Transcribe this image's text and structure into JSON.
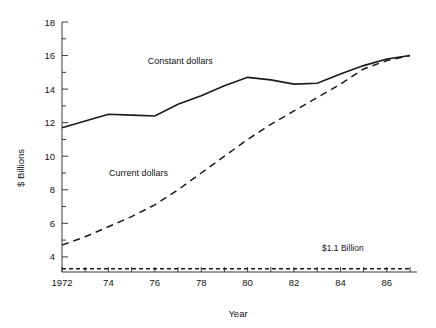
{
  "chart_data": {
    "type": "line",
    "title": "",
    "xlabel": "Year",
    "ylabel": "$ Billions",
    "xlim": [
      1972,
      1987.3
    ],
    "ylim": [
      3.1,
      18
    ],
    "grid": false,
    "legend": "inline-labels",
    "y_ticks_major": [
      4,
      6,
      8,
      10,
      12,
      14,
      16,
      18
    ],
    "y_ticks_minor": [
      5,
      7,
      9,
      11,
      13,
      15,
      17
    ],
    "y_tick_labels": [
      "4",
      "6",
      "8",
      "10",
      "12",
      "14",
      "16",
      "18"
    ],
    "x_ticks": [
      1972,
      1973,
      1974,
      1975,
      1976,
      1977,
      1978,
      1979,
      1980,
      1981,
      1982,
      1983,
      1984,
      1985,
      1986,
      1987
    ],
    "x_tick_labels": [
      "1972",
      "",
      "74",
      "",
      "76",
      "",
      "78",
      "",
      "80",
      "",
      "82",
      "",
      "84",
      "",
      "86",
      ""
    ],
    "x": [
      1972,
      1973,
      1974,
      1975,
      1976,
      1977,
      1978,
      1979,
      1980,
      1981,
      1982,
      1983,
      1984,
      1985,
      1986,
      1987
    ],
    "series": [
      {
        "name": "Constant dollars",
        "style": "solid",
        "color": "#1a1a1a",
        "label": "Constant dollars",
        "values": [
          11.7,
          12.1,
          12.5,
          12.45,
          12.4,
          13.1,
          13.6,
          14.2,
          14.7,
          14.55,
          14.3,
          14.35,
          14.9,
          15.4,
          15.8,
          16.0
        ]
      },
      {
        "name": "Current dollars",
        "style": "dashed",
        "color": "#1a1a1a",
        "label": "Current dollars",
        "values": [
          4.7,
          5.2,
          5.8,
          6.4,
          7.1,
          8.0,
          9.0,
          10.0,
          11.0,
          11.9,
          12.7,
          13.5,
          14.3,
          15.2,
          15.7,
          16.0
        ]
      },
      {
        "name": "Baseline",
        "style": "dotted",
        "color": "#1a1a1a",
        "label": "$1.1 Billion",
        "values": [
          3.3,
          3.3,
          3.3,
          3.3,
          3.3,
          3.3,
          3.3,
          3.3,
          3.3,
          3.3,
          3.3,
          3.3,
          3.3,
          3.3,
          3.3,
          3.3
        ]
      }
    ],
    "annotations": [
      {
        "text": "Constant dollars",
        "x": 1977.1,
        "y": 15.5
      },
      {
        "text": "Current dollars",
        "x": 1975.3,
        "y": 8.85
      },
      {
        "text": "$1.1 Billion",
        "x": 1985.0,
        "y": 4.35
      }
    ]
  }
}
